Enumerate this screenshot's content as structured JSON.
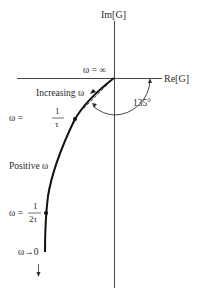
{
  "diagram": {
    "type": "polar-plot",
    "axes": {
      "imag_label": "Im[G]",
      "real_label": "Re[G]"
    },
    "labels": {
      "omega_infinity": "ω = ∞",
      "increasing_omega": "Increasing ω",
      "omega_1_tau_lhs": "ω =",
      "omega_1_tau_num": "1",
      "omega_1_tau_den": "τ",
      "positive_omega": "Positive ω",
      "omega_half_tau_lhs": "ω =",
      "omega_half_tau_num": "1",
      "omega_half_tau_den": "2τ",
      "omega_to_zero": "ω→0",
      "angle": "135°"
    },
    "colors": {
      "line": "#1a1a1a",
      "text": "#2a2a2a",
      "background": "#ffffff"
    }
  }
}
